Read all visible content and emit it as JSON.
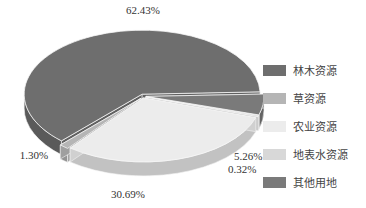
{
  "chart_data": {
    "type": "pie",
    "style": "3d-exploded",
    "title": "",
    "categories": [
      "林木资源",
      "草资源",
      "农业资源",
      "地表水资源",
      "其他用地"
    ],
    "values": [
      62.43,
      1.3,
      30.69,
      0.32,
      5.26
    ],
    "labels": [
      "62.43%",
      "1.30%",
      "30.69%",
      "0.32%",
      "5.26%"
    ],
    "colors": [
      "#6e6e6e",
      "#b5b5b5",
      "#ececec",
      "#d8d8d8",
      "#7a7a7a"
    ],
    "legend_position": "right"
  },
  "legend": {
    "items": [
      {
        "label": "林木资源",
        "color": "#6e6e6e"
      },
      {
        "label": "草资源",
        "color": "#b5b5b5"
      },
      {
        "label": "农业资源",
        "color": "#ececec"
      },
      {
        "label": "地表水资源",
        "color": "#d8d8d8"
      },
      {
        "label": "其他用地",
        "color": "#7a7a7a"
      }
    ]
  }
}
